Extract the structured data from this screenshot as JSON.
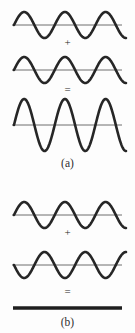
{
  "figure": {
    "background_color": "#fdfdfd",
    "wave_stroke_color": "#262626",
    "axis_stroke_color": "#6f6f6f",
    "flatline_color": "#1f1f1f"
  },
  "panels": [
    {
      "id": "a",
      "label": "(a)",
      "interference_type": "constructive",
      "rows": [
        {
          "name": "wave-1",
          "kind": "wave",
          "axis_y": 25,
          "amplitude": 13,
          "cycles": 2.75,
          "phase_deg": 0,
          "x_start": 14,
          "x_end": 126,
          "axis_x_start": 12,
          "axis_x_end": 122,
          "stroke_width": 2.6
        },
        {
          "name": "operator-plus",
          "kind": "operator",
          "symbol": "+"
        },
        {
          "name": "wave-2",
          "kind": "wave",
          "axis_y": 70,
          "amplitude": 13,
          "cycles": 2.75,
          "phase_deg": 0,
          "x_start": 14,
          "x_end": 126,
          "axis_x_start": 12,
          "axis_x_end": 122,
          "stroke_width": 2.6
        },
        {
          "name": "operator-equals",
          "kind": "operator",
          "symbol": "="
        },
        {
          "name": "wave-sum",
          "kind": "wave",
          "axis_y": 125,
          "amplitude": 26,
          "cycles": 2.75,
          "phase_deg": 0,
          "x_start": 14,
          "x_end": 126,
          "axis_x_start": 12,
          "axis_x_end": 122,
          "stroke_width": 2.6
        }
      ]
    },
    {
      "id": "b",
      "label": "(b)",
      "interference_type": "destructive",
      "rows": [
        {
          "name": "wave-1",
          "kind": "wave",
          "axis_y": 215,
          "amplitude": 13,
          "cycles": 2.75,
          "phase_deg": 0,
          "x_start": 14,
          "x_end": 126,
          "axis_x_start": 12,
          "axis_x_end": 122,
          "stroke_width": 2.6
        },
        {
          "name": "operator-plus",
          "kind": "operator",
          "symbol": "+"
        },
        {
          "name": "wave-2-inverted",
          "kind": "wave",
          "axis_y": 265,
          "amplitude": 13,
          "cycles": 2.75,
          "phase_deg": 180,
          "x_start": 14,
          "x_end": 126,
          "axis_x_start": 12,
          "axis_x_end": 122,
          "stroke_width": 2.6
        },
        {
          "name": "operator-equals",
          "kind": "operator",
          "symbol": "="
        },
        {
          "name": "flat-line-result",
          "kind": "flatline",
          "axis_y": 308,
          "x_start": 13,
          "x_end": 122,
          "stroke_width": 3.4
        }
      ]
    }
  ],
  "operators": {
    "panel_a_plus": "+",
    "panel_a_equals": "=",
    "panel_b_plus": "+",
    "panel_b_equals": "="
  },
  "labels": {
    "panel_a": "(a)",
    "panel_b": "(b)"
  }
}
